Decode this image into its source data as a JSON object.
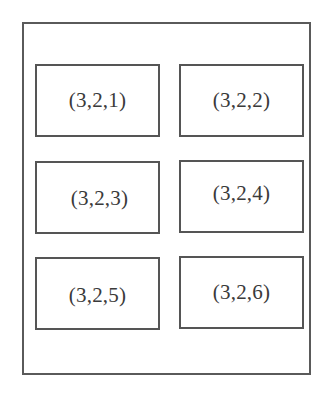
{
  "diagram": {
    "grid": {
      "rows": 3,
      "cols": 2
    },
    "cells": [
      {
        "label": "(3,2,1)",
        "row": 1,
        "col": 1
      },
      {
        "label": "(3,2,2)",
        "row": 1,
        "col": 2
      },
      {
        "label": "(3,2,3)",
        "row": 2,
        "col": 1
      },
      {
        "label": "(3,2,4)",
        "row": 2,
        "col": 2
      },
      {
        "label": "(3,2,5)",
        "row": 3,
        "col": 1
      },
      {
        "label": "(3,2,6)",
        "row": 3,
        "col": 2
      }
    ],
    "colors": {
      "border": "#555555",
      "text": "#3a3a3a",
      "background": "#ffffff"
    }
  }
}
